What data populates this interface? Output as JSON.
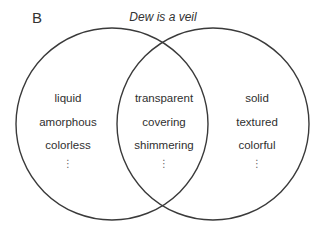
{
  "panel_label": "B",
  "title": "Dew is a veil",
  "diagram": {
    "type": "venn",
    "circles": [
      {
        "name": "left",
        "cx": 112,
        "cy": 124,
        "r": 96
      },
      {
        "name": "right",
        "cx": 213,
        "cy": 124,
        "r": 96
      }
    ],
    "stroke_color": "#3a3a3a"
  },
  "regions": {
    "left_only": {
      "items": [
        "liquid",
        "amorphous",
        "colorless"
      ],
      "more": "⋮"
    },
    "overlap": {
      "items": [
        "transparent",
        "covering",
        "shimmering"
      ],
      "more": "⋮"
    },
    "right_only": {
      "items": [
        "solid",
        "textured",
        "colorful"
      ],
      "more": "⋮"
    }
  }
}
